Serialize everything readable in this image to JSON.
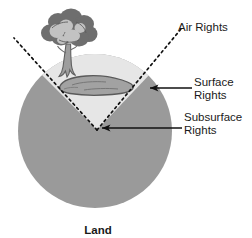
{
  "diagram": {
    "bottom_caption": "Land",
    "labels": {
      "air_rights": "Air Rights",
      "surface_rights_line1": "Surface",
      "surface_rights_line2": "Rights",
      "subsurface_rights_line1": "Subsurface",
      "subsurface_rights_line2": "Rights"
    },
    "colors": {
      "subsurface_fill": "#9a9a9a",
      "surface_wedge_fill": "#e3e3e3",
      "surface_top_band": "#d2d2d2",
      "lake_fill": "#9c9c9c",
      "lake_outline": "#5e5e5e",
      "tree_canopy_dark": "#6f6f6f",
      "tree_canopy_light": "#bdbdbd",
      "tree_trunk": "#9a9a9a",
      "line_black": "#111111",
      "text": "#1a1a1a",
      "background": "#ffffff"
    },
    "geometry": {
      "circle_center_x": 95,
      "circle_center_y": 131,
      "circle_radius": 77,
      "wedge_vertex_x": 97,
      "wedge_vertex_y": 130,
      "dashed_left_end_x": 14,
      "dashed_left_end_y": 38,
      "dashed_right_end_x": 181,
      "dashed_right_end_y": 29
    },
    "icons": {
      "tree": "tree-icon",
      "lake": "lake-icon",
      "arrow_surface": "arrow-left-icon",
      "arrow_subsurface": "arrow-left-icon"
    }
  }
}
